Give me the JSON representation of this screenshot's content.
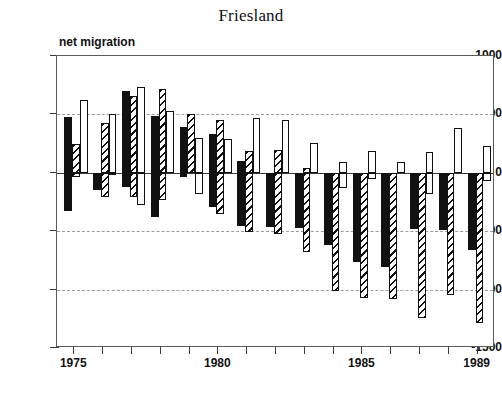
{
  "chart": {
    "title": "Friesland",
    "y_axis_label": "net migration",
    "y_ticks": [
      "1000",
      "500",
      "0",
      "-500",
      "-1000",
      "-1500"
    ],
    "x_ticks_labeled": [
      "1975",
      "1980",
      "1985",
      "1989"
    ]
  },
  "chart_data": {
    "type": "bar",
    "title": "Friesland",
    "subtitle": "",
    "xlabel": "",
    "ylabel": "net migration",
    "ylim": [
      -1500,
      1000
    ],
    "xlim": [
      1974.4,
      1989.6
    ],
    "grid": true,
    "legend": "none",
    "y_tick_values": [
      1000,
      500,
      0,
      -500,
      -1000,
      -1500
    ],
    "x_tick_values": [
      1975,
      1976,
      1977,
      1978,
      1979,
      1980,
      1981,
      1982,
      1983,
      1984,
      1985,
      1986,
      1987,
      1988,
      1989
    ],
    "x_tick_labels_shown": [
      1975,
      1980,
      1985,
      1989
    ],
    "categories": [
      1975,
      1976,
      1977,
      1978,
      1979,
      1980,
      1981,
      1982,
      1983,
      1984,
      1985,
      1986,
      1987,
      1988,
      1989
    ],
    "series": [
      {
        "name": "series-1",
        "style": "solid-black",
        "positive": [
          480,
          0,
          700,
          490,
          395,
          330,
          100,
          0,
          0,
          0,
          0,
          0,
          0,
          0,
          0
        ],
        "negative": [
          -330,
          -150,
          -125,
          -375,
          -35,
          -290,
          -455,
          -460,
          -470,
          -620,
          -760,
          -810,
          -480,
          -490,
          -660
        ]
      },
      {
        "name": "series-2",
        "style": "hatched",
        "positive": [
          245,
          430,
          660,
          715,
          505,
          455,
          190,
          195,
          40,
          0,
          0,
          0,
          0,
          0,
          0
        ],
        "negative": [
          -35,
          -210,
          -210,
          -230,
          0,
          -355,
          -510,
          -520,
          -680,
          -1010,
          -1070,
          -1080,
          -1240,
          -1050,
          -1290
        ]
      },
      {
        "name": "series-3",
        "style": "open-white",
        "positive": [
          620,
          500,
          735,
          530,
          300,
          290,
          470,
          455,
          255,
          90,
          190,
          95,
          180,
          385,
          230
        ],
        "negative": [
          0,
          -5,
          -275,
          0,
          -185,
          0,
          0,
          0,
          0,
          -130,
          -55,
          0,
          -185,
          0,
          -70
        ]
      }
    ]
  }
}
